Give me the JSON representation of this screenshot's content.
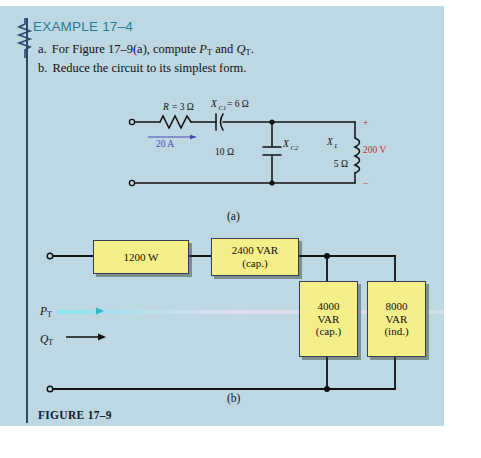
{
  "header": {
    "title": "EXAMPLE 17–4"
  },
  "problem": {
    "item_a_label": "a.",
    "item_a_text_1": "For Figure 17–9(a), compute ",
    "item_a_p": "P",
    "item_a_p_sub": "T",
    "item_a_and": " and ",
    "item_a_q": "Q",
    "item_a_q_sub": "T",
    "item_a_end": ".",
    "item_b_label": "b.",
    "item_b_text": "Reduce the circuit to its simplest form."
  },
  "circuit_a": {
    "caption": "(a)",
    "resistor": {
      "symbol": "R",
      "equals": "= 3 Ω"
    },
    "cap1": {
      "symbol": "X",
      "sub": "C1",
      "equals": "= 6 Ω"
    },
    "cap2": {
      "symbol": "X",
      "sub": "C2",
      "value": "10 Ω"
    },
    "inductor": {
      "symbol": "X",
      "sub": "L",
      "value": "5 Ω"
    },
    "source_current": "20 A",
    "source_voltage": "200 V",
    "polarity_plus": "+",
    "polarity_minus": "−"
  },
  "circuit_b": {
    "caption": "(b)",
    "p_label": "P",
    "p_sub": "T",
    "q_label": "Q",
    "q_sub": "T",
    "blocks": [
      {
        "name": "real-power-block",
        "line1": "1200 W",
        "line2": ""
      },
      {
        "name": "reactive-cap-2400-block",
        "line1": "2400 VAR",
        "line2": "(cap.)"
      },
      {
        "name": "reactive-cap-4000-block",
        "line1": "4000",
        "line2": "VAR",
        "line3": "(cap.)"
      },
      {
        "name": "reactive-ind-8000-block",
        "line1": "8000",
        "line2": "VAR",
        "line3": "(ind.)"
      }
    ]
  },
  "figure_number": "FIGURE 17–9",
  "colors": {
    "panel_bg": "#bdd7e3",
    "heading": "#1d7f96",
    "rule": "#2a4a6b",
    "block_fill": "#f5ef8a",
    "block_border": "#3a3a52",
    "current_label": "#4a4ab4",
    "voltage_label": "#c8302b",
    "highlight": "#7fe8ee"
  }
}
